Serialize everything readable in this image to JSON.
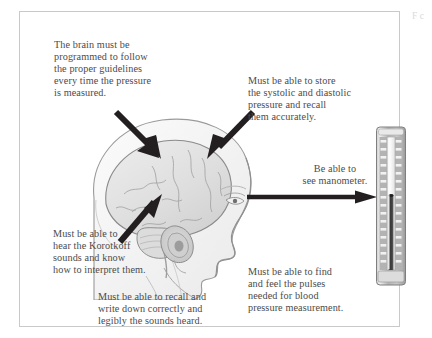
{
  "figure": {
    "clipped_caption_fragment": "F\nc",
    "frame_color": "#c9c9c9",
    "text_color": "#4b4b4b",
    "arrow_color": "#231f20"
  },
  "annotations": {
    "brain_program": "The brain must be\nprogrammed to follow\nthe proper guidelines\nevery time the pressure\nis measured.",
    "store_recall": "Must be able to store\nthe systolic and diastolic\npressure and recall\nthem accurately.",
    "see_manometer": "Be able to\nsee manometer.",
    "korotkoff": "Must be able to\nhear the Korotkoff\nsounds and know\nhow to interpret them.",
    "write_down": "Must be able to recall and\nwrite down correctly and\nlegibly the sounds heard.",
    "find_pulses": "Must be able to find\nand feel the pulses\nneeded for blood\npressure measurement."
  },
  "illustration": {
    "name": "human-head-profile-with-brain",
    "label": "Lateral view of human head showing brain, ear and facial profile",
    "skin_fill": "#f4f4f4",
    "brain_fill": "#e3e3e3",
    "outline_color": "#8c8c8c"
  },
  "arrows": [
    {
      "name": "arrow-to-left-brain",
      "target": "frontal region of brain",
      "direction": "down-right"
    },
    {
      "name": "arrow-to-right-brain",
      "target": "parietal region of brain",
      "direction": "down-left"
    },
    {
      "name": "arrow-to-ear",
      "target": "ear canal",
      "direction": "up-right"
    },
    {
      "name": "arrow-to-manometer",
      "target": "mercury manometer",
      "direction": "right"
    }
  ],
  "manometer": {
    "name": "mercury-column-manometer",
    "label": "Mercury column sphygmomanometer gauge",
    "body_fill": "#b9b9b9",
    "column_fill": "#f7f7f7",
    "mercury_fill": "#4a4a4a",
    "scale_tick_count": 16,
    "mercury_level_percent": 56
  }
}
